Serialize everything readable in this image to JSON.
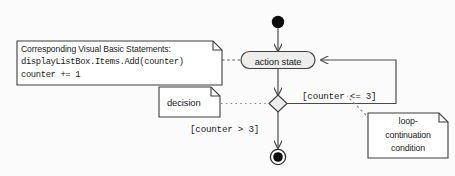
{
  "diagram": {
    "kind": "uml-activity-diagram",
    "background_color": "#fbfbfb",
    "stroke_color": "#404040",
    "fill_color": "#ededed",
    "note_fill_color": "#ffffff",
    "text_color": "#1a1a1a",
    "initial_state": {
      "name": "initial-state",
      "shape": "filled-circle"
    },
    "final_state": {
      "name": "final-state",
      "shape": "bullseye"
    },
    "action_state": {
      "label": "action state",
      "shape": "rounded-rectangle"
    },
    "decision": {
      "shape": "diamond"
    },
    "guards": [
      {
        "id": "guard-loop",
        "text": "[counter <= 3]"
      },
      {
        "id": "guard-exit",
        "text": "[counter > 3]"
      }
    ],
    "notes": [
      {
        "id": "vb-statements-note",
        "lines": [
          {
            "text": "Corresponding Visual Basic Statements:",
            "style": "proportional"
          },
          {
            "text": "displayListBox.Items.Add(counter)",
            "style": "monospace"
          },
          {
            "text": "counter += 1",
            "style": "monospace"
          }
        ]
      },
      {
        "id": "decision-note",
        "lines": [
          {
            "text": "decision",
            "style": "proportional"
          }
        ]
      },
      {
        "id": "loop-continuation-note",
        "lines": [
          {
            "text": "loop-",
            "style": "proportional"
          },
          {
            "text": "continuation",
            "style": "proportional"
          },
          {
            "text": "condition",
            "style": "proportional"
          }
        ]
      }
    ]
  }
}
